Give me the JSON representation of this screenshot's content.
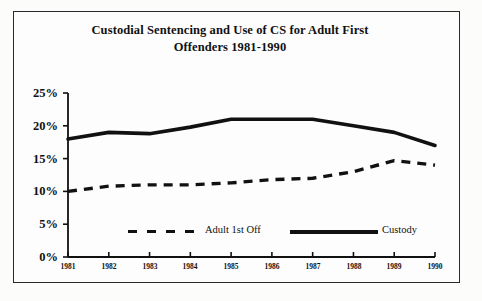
{
  "chart_data": {
    "type": "line",
    "title": "Custodial Sentencing and Use of CS for Adult First Offenders 1981-1990",
    "title_line1": "Custodial Sentencing and Use of CS for Adult First",
    "title_line2": "Offenders 1981-1990",
    "xlabel": "",
    "ylabel": "",
    "categories": [
      "1981",
      "1982",
      "1983",
      "1984",
      "1985",
      "1986",
      "1987",
      "1988",
      "1989",
      "1990"
    ],
    "ytick_labels": [
      "0%",
      "5%",
      "10%",
      "15%",
      "20%",
      "25%"
    ],
    "ytick_values": [
      0,
      5,
      10,
      15,
      20,
      25
    ],
    "ylim": [
      0,
      25
    ],
    "grid": false,
    "legend_position": "inside-bottom",
    "series": [
      {
        "name": "Adult 1st Off",
        "style": "dashed",
        "color": "#111111",
        "values": [
          10,
          10.8,
          11,
          11,
          11.3,
          11.8,
          12,
          13,
          14.7,
          14
        ]
      },
      {
        "name": "Custody",
        "style": "solid",
        "color": "#111111",
        "values": [
          18,
          19,
          18.8,
          19.8,
          21,
          21,
          21,
          20,
          19,
          17
        ]
      }
    ]
  },
  "legend": {
    "item1_label": "Adult 1st Off",
    "item2_label": "Custody"
  },
  "colors": {
    "ink": "#111111",
    "frame": "#2a2a2a",
    "paper": "#fdfdfd"
  }
}
